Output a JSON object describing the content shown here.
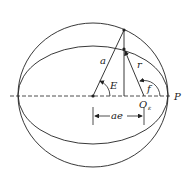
{
  "diagram": {
    "labels": {
      "semi_major": "a",
      "radius": "r",
      "eccentric_anomaly": "E",
      "true_anomaly": "f",
      "focus": "O",
      "focus_subscript": "ε",
      "periapsis": "P",
      "distance": "ae"
    },
    "colors": {
      "stroke": "#222222",
      "background": "#ffffff"
    }
  }
}
